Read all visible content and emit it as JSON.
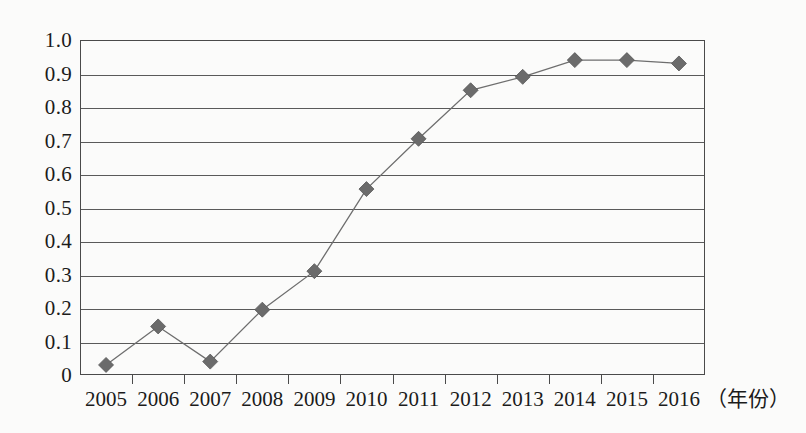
{
  "chart_data": {
    "type": "line",
    "title": "",
    "subtitle": "",
    "xlabel": "（年份）",
    "ylabel": "",
    "categories": [
      "2005",
      "2006",
      "2007",
      "2008",
      "2009",
      "2010",
      "2011",
      "2012",
      "2013",
      "2014",
      "2015",
      "2016"
    ],
    "values": [
      0.03,
      0.145,
      0.04,
      0.195,
      0.31,
      0.555,
      0.705,
      0.85,
      0.89,
      0.94,
      0.94,
      0.93
    ],
    "series": [
      {
        "name": "",
        "values": [
          0.03,
          0.145,
          0.04,
          0.195,
          0.31,
          0.555,
          0.705,
          0.85,
          0.89,
          0.94,
          0.94,
          0.93
        ]
      }
    ],
    "ylim": [
      0,
      1.0
    ],
    "ytick_labels": [
      "1.0",
      "0.9",
      "0.8",
      "0.7",
      "0.6",
      "0.5",
      "0.4",
      "0.3",
      "0.2",
      "0.1",
      "0"
    ],
    "ytick_values": [
      1.0,
      0.9,
      0.8,
      0.7,
      0.6,
      0.5,
      0.4,
      0.3,
      0.2,
      0.1,
      0
    ],
    "ystep": 0.1,
    "grid": true,
    "grid_axis": "y",
    "legend": false,
    "legend_position": "none",
    "marker": "diamond",
    "annotations": []
  },
  "style": {
    "background_color": "#fbfbfa",
    "axis_color": "#4a4a4a",
    "gridline_color": "#5a5a5a",
    "line_color": "#6e6e6e",
    "marker_color": "#6b6b6b",
    "text_color": "#1b1b1b"
  },
  "axis": {
    "x_unit_label": "（年份）"
  }
}
